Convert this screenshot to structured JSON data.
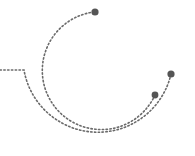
{
  "graphic": {
    "description": "Decorative dotted orbit arcs with endpoint dots",
    "colors": {
      "dot": "#555555",
      "line": "#6a6a6a",
      "background": "#ffffff"
    }
  }
}
